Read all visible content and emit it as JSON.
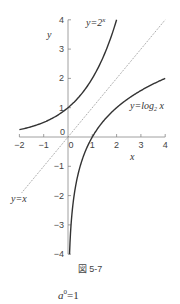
{
  "chart_data": {
    "type": "line",
    "title": "",
    "xlabel": "x",
    "ylabel": "y",
    "xlim": [
      -2,
      4
    ],
    "ylim": [
      -4,
      4
    ],
    "grid": false,
    "x_ticks": [
      "-2",
      "-1",
      "0",
      "1",
      "2",
      "3",
      "4"
    ],
    "y_ticks": [
      "4",
      "3",
      "2",
      "1",
      "0",
      "-1",
      "-2",
      "-3",
      "-4"
    ],
    "series": [
      {
        "name": "y=2^x",
        "label": "y=2",
        "sup": "x",
        "style": "solid",
        "x": [
          -2,
          -1,
          0,
          1,
          2
        ],
        "y": [
          0.25,
          0.5,
          1,
          2,
          4
        ]
      },
      {
        "name": "y=log2 x",
        "label": "y=log",
        "sub": "2",
        "label_tail": " x",
        "style": "solid",
        "x": [
          0.0625,
          0.125,
          0.25,
          0.5,
          1,
          2,
          4
        ],
        "y": [
          -4,
          -3,
          -2,
          -1,
          0,
          1,
          2
        ]
      },
      {
        "name": "y=x",
        "label": "y=x",
        "style": "dotted",
        "x": [
          -2,
          4
        ],
        "y": [
          -2,
          4
        ]
      }
    ]
  },
  "figure": {
    "caption": "図 5-7",
    "origin_label": "0"
  },
  "formula": {
    "base": "a",
    "exponent": "0",
    "rest": "=1"
  }
}
